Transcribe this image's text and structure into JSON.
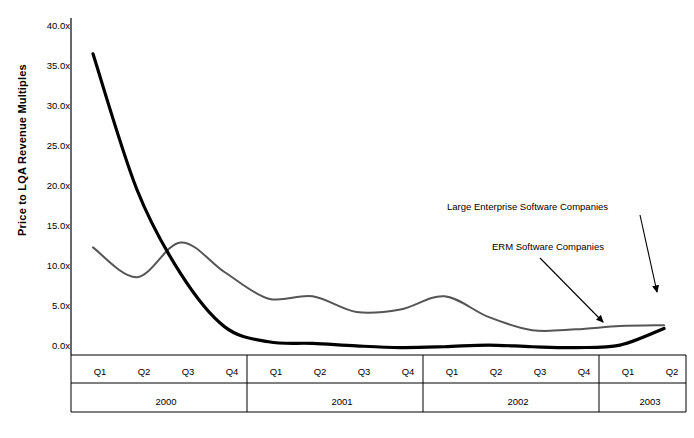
{
  "chart_data": {
    "type": "line",
    "title": "",
    "xlabel": "",
    "ylabel": "Price to LQA Revenue Multiples",
    "ylim": [
      0,
      40
    ],
    "ytick_labels": [
      "40.0x",
      "35.0x",
      "30.0x",
      "25.0x",
      "20.0x",
      "15.0x",
      "10.0x",
      "5.0x",
      "0.0x"
    ],
    "ytick_values": [
      40,
      35,
      30,
      25,
      20,
      15,
      10,
      5,
      0
    ],
    "grid": false,
    "legend_position": "annotations-right",
    "categories": [
      "Q1",
      "Q2",
      "Q3",
      "Q4",
      "Q1",
      "Q2",
      "Q3",
      "Q4",
      "Q1",
      "Q2",
      "Q3",
      "Q4",
      "Q1",
      "Q2"
    ],
    "year_groups": [
      {
        "label": "2000",
        "quarters": [
          "Q1",
          "Q2",
          "Q3",
          "Q4"
        ]
      },
      {
        "label": "2001",
        "quarters": [
          "Q1",
          "Q2",
          "Q3",
          "Q4"
        ]
      },
      {
        "label": "2002",
        "quarters": [
          "Q1",
          "Q2",
          "Q3",
          "Q4"
        ]
      },
      {
        "label": "2003",
        "quarters": [
          "Q1",
          "Q2"
        ]
      }
    ],
    "series": [
      {
        "name": "ERM Software Companies",
        "color": "#000000",
        "width": 3.2,
        "values": [
          36.4,
          20.0,
          9.8,
          3.4,
          1.6,
          1.4,
          1.1,
          0.9,
          1.0,
          1.2,
          1.0,
          0.9,
          1.2,
          3.2
        ]
      },
      {
        "name": "Large Enterprise Software Companies",
        "color": "#555555",
        "width": 2.0,
        "values": [
          13.0,
          9.4,
          13.6,
          10.0,
          6.8,
          7.1,
          5.2,
          5.5,
          7.1,
          4.6,
          3.0,
          3.1,
          3.5,
          3.6
        ]
      }
    ],
    "annotations": [
      {
        "id": "large-enterprise",
        "text": "Large Enterprise Software Companies",
        "target_series": "Large Enterprise Software Companies"
      },
      {
        "id": "erm",
        "text": "ERM Software Companies",
        "target_series": "ERM Software Companies"
      }
    ]
  }
}
